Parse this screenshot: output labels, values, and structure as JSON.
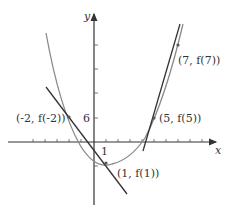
{
  "diagram": {
    "type": "function-graph-with-tangents",
    "axes": {
      "x_label": "x",
      "y_label": "y",
      "x_tick_label": "1",
      "y_tick_label": "6"
    },
    "points": [
      {
        "label": "(-2, f(-2))",
        "x": -2,
        "y": 6
      },
      {
        "label": "(1, f(1))",
        "x": 1,
        "y": -5
      },
      {
        "label": "(5, f(5))",
        "x": 5,
        "y": 6
      },
      {
        "label": "(7, f(7))",
        "x": 7,
        "y": 24
      }
    ],
    "colors": {
      "curve": "#8a8a8a",
      "tangent": "#333333",
      "axis": "#333333"
    }
  }
}
